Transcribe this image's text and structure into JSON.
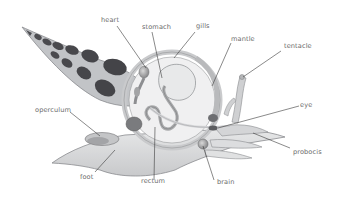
{
  "diagram": {
    "colors": {
      "shell_dark": "#4a4a4e",
      "shell_light": "#bfc1c4",
      "body": "#d9dadc",
      "outline": "#8a8c8f",
      "leader_line": "#3a3a3a",
      "label_text": "#6b6b6b"
    },
    "labels": [
      {
        "id": "heart",
        "text": "heart"
      },
      {
        "id": "stomach",
        "text": "stomach"
      },
      {
        "id": "gills",
        "text": "gills"
      },
      {
        "id": "mantle",
        "text": "mantle"
      },
      {
        "id": "tentacle",
        "text": "tentacle"
      },
      {
        "id": "eye",
        "text": "eye"
      },
      {
        "id": "probocis",
        "text": "probocis"
      },
      {
        "id": "brain",
        "text": "brain"
      },
      {
        "id": "rectum",
        "text": "rectum"
      },
      {
        "id": "foot",
        "text": "foot"
      },
      {
        "id": "operculum",
        "text": "operculum"
      }
    ]
  }
}
